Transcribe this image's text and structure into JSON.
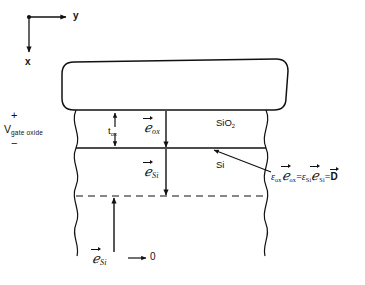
{
  "figure": {
    "background_color": "#ffffff",
    "line_color": "#111111"
  },
  "axes": {
    "origin_marker": "dot",
    "horizontal": {
      "label": "y",
      "direction": "right"
    },
    "vertical": {
      "label": "x",
      "direction": "down"
    }
  },
  "bias": {
    "plus_sign": "+",
    "minus_sign": "−",
    "label_main": "V",
    "label_subscript": "gate oxide"
  },
  "thickness": {
    "label_main": "t",
    "label_subscript": "ox",
    "arrow_style": "double-headed-vertical"
  },
  "fields": {
    "oxide": {
      "symbol": "ℯ",
      "subscript": "ox",
      "vector": true,
      "arrow_direction": "down"
    },
    "silicon": {
      "symbol": "ℯ",
      "subscript": "Si",
      "vector": true,
      "arrow_direction": "down"
    },
    "silicon_bulk": {
      "symbol": "ℯ",
      "subscript": "Si",
      "vector": true,
      "arrow_direction": "up",
      "relation_arrow": "⟶",
      "limit_value": "0"
    }
  },
  "materials": {
    "oxide_label": "SiO",
    "oxide_subscript": "2",
    "semiconductor_label": "Si"
  },
  "equation": {
    "eps_ox": "ε",
    "eps_ox_sub": "ox",
    "field_ox": "ℯ",
    "field_ox_sub": "ox",
    "equals_1": "=",
    "eps_si": "ε",
    "eps_si_sub": "Si",
    "field_si": "ℯ",
    "field_si_sub": "Si",
    "equals_2": "=",
    "displacement": "D",
    "leader": "pointer-to-oxide-silicon-interface"
  }
}
